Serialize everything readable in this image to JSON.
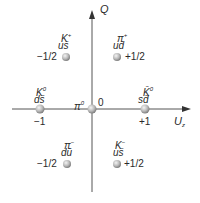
{
  "diagram": {
    "type": "meson-octet-weight-diagram",
    "axes": {
      "vertical": {
        "label": "Q"
      },
      "horizontal": {
        "label": "U",
        "label_subscript": "z"
      }
    },
    "particles": [
      {
        "name": "K",
        "charge_sup": "+",
        "quarks": "us̄",
        "value": "−1/2",
        "value_side": "left"
      },
      {
        "name": "π",
        "charge_sup": "+",
        "quarks": "ud̄",
        "value": "+1/2",
        "value_side": "right"
      },
      {
        "name": "K",
        "charge_sup": "0",
        "quarks": "ds̄",
        "value": "−1",
        "value_side": "below"
      },
      {
        "name": "π",
        "charge_sup": "0",
        "quarks": "",
        "value": "0",
        "value_side": "right"
      },
      {
        "name": "K̄",
        "charge_sup": "0",
        "quarks": "sd̄",
        "value": "+1",
        "value_side": "below"
      },
      {
        "name": "π",
        "charge_sup": "−",
        "quarks": "dū",
        "value": "−1/2",
        "value_side": "left"
      },
      {
        "name": "K",
        "charge_sup": "−",
        "quarks": "us̄",
        "value": "+1/2",
        "value_side": "right"
      }
    ]
  },
  "colors": {
    "axis": "#555555",
    "sphere_light": "#eeeeee",
    "sphere_dark": "#8a8a8a",
    "text": "#2a2a2a"
  }
}
